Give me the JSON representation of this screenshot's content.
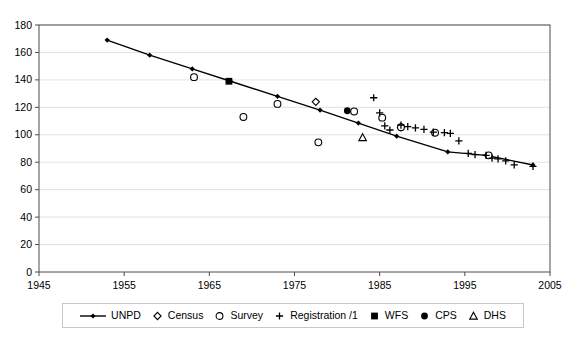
{
  "chart_data": {
    "type": "scatter",
    "title": "",
    "xlabel": "",
    "ylabel": "",
    "xlim": [
      1945,
      2005
    ],
    "ylim": [
      0,
      180
    ],
    "xticks": [
      1945,
      1955,
      1965,
      1975,
      1985,
      1995,
      2005
    ],
    "yticks": [
      0,
      20,
      40,
      60,
      80,
      100,
      120,
      140,
      160,
      180
    ],
    "grid": "horizontal",
    "legend_position": "bottom",
    "series": [
      {
        "name": "UNPD",
        "marker": "line-diamond",
        "points": [
          [
            1953,
            169
          ],
          [
            1958,
            158
          ],
          [
            1963,
            148
          ],
          [
            1967.5,
            139
          ],
          [
            1973,
            128
          ],
          [
            1978,
            118
          ],
          [
            1982.5,
            108.5
          ],
          [
            1987,
            99
          ],
          [
            1993,
            87.5
          ],
          [
            1997.5,
            85
          ],
          [
            2003,
            78
          ]
        ]
      },
      {
        "name": "Census",
        "marker": "open-diamond",
        "points": [
          [
            1977.5,
            124
          ],
          [
            1987.5,
            105.5
          ]
        ]
      },
      {
        "name": "Survey",
        "marker": "open-circle",
        "points": [
          [
            1963.2,
            142
          ],
          [
            1969,
            113
          ],
          [
            1973,
            122.5
          ],
          [
            1977.8,
            94.5
          ],
          [
            1982,
            117
          ],
          [
            1985.3,
            112.5
          ],
          [
            1987.5,
            105.5
          ],
          [
            1991.5,
            101.5
          ],
          [
            1997.8,
            85
          ]
        ]
      },
      {
        "name": "Registration /1",
        "marker": "plus",
        "points": [
          [
            1984.3,
            127
          ],
          [
            1985,
            116
          ],
          [
            1985.6,
            106.5
          ],
          [
            1986.2,
            103.5
          ],
          [
            1987.5,
            107
          ],
          [
            1988.3,
            106
          ],
          [
            1989.2,
            105
          ],
          [
            1990.2,
            104
          ],
          [
            1991.3,
            102
          ],
          [
            1992.6,
            101.5
          ],
          [
            1993.3,
            101
          ],
          [
            1994.3,
            95.5
          ],
          [
            1995.4,
            86.5
          ],
          [
            1996.2,
            85.5
          ],
          [
            1997.5,
            85
          ],
          [
            1998.2,
            83
          ],
          [
            1998.9,
            82.5
          ],
          [
            1999.8,
            81
          ],
          [
            2000.8,
            78
          ],
          [
            2003,
            77
          ]
        ]
      },
      {
        "name": "WFS",
        "marker": "filled-square",
        "points": [
          [
            1967.3,
            139
          ]
        ]
      },
      {
        "name": "CPS",
        "marker": "filled-circle",
        "points": [
          [
            1981.2,
            117.5
          ]
        ]
      },
      {
        "name": "DHS",
        "marker": "open-triangle",
        "points": [
          [
            1983,
            98
          ]
        ]
      }
    ]
  },
  "legend": {
    "items": [
      {
        "label": "UNPD",
        "marker": "line-diamond"
      },
      {
        "label": "Census",
        "marker": "open-diamond"
      },
      {
        "label": "Survey",
        "marker": "open-circle"
      },
      {
        "label": "Registration /1",
        "marker": "plus"
      },
      {
        "label": "WFS",
        "marker": "filled-square"
      },
      {
        "label": "CPS",
        "marker": "filled-circle"
      },
      {
        "label": "DHS",
        "marker": "open-triangle"
      }
    ]
  }
}
